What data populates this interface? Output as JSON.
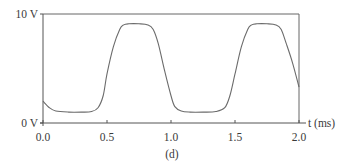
{
  "chart_data": {
    "type": "line",
    "title": "",
    "caption": "(d)",
    "xlabel": "t (ms)",
    "ylabel": "",
    "xlim": [
      0.0,
      2.0
    ],
    "ylim": [
      0,
      10
    ],
    "x_ticks": [
      "0.0",
      "0.5",
      "1.0",
      "1.5",
      "2.0"
    ],
    "y_ticks": [
      "0 V",
      "10 V"
    ],
    "grid": false,
    "legend": null,
    "series": [
      {
        "name": "voltage",
        "x": [
          0.0,
          0.05,
          0.1,
          0.2,
          0.3,
          0.38,
          0.43,
          0.47,
          0.5,
          0.55,
          0.6,
          0.63,
          0.67,
          0.75,
          0.82,
          0.86,
          0.9,
          0.95,
          1.0,
          1.03,
          1.08,
          1.15,
          1.25,
          1.35,
          1.42,
          1.46,
          1.5,
          1.55,
          1.6,
          1.63,
          1.67,
          1.75,
          1.82,
          1.86,
          1.9,
          1.95,
          2.0
        ],
        "y": [
          2.0,
          1.4,
          1.1,
          1.0,
          1.0,
          1.05,
          1.4,
          2.5,
          4.5,
          7.0,
          8.6,
          9.0,
          9.1,
          9.1,
          9.0,
          8.6,
          7.3,
          4.8,
          2.5,
          1.5,
          1.1,
          1.0,
          1.0,
          1.05,
          1.4,
          2.5,
          4.5,
          7.0,
          8.6,
          9.0,
          9.1,
          9.1,
          9.0,
          8.6,
          7.3,
          5.5,
          3.3
        ]
      }
    ],
    "axis_color": "#555555",
    "line_color": "#6b6b6b"
  },
  "labels": {
    "y_top": "10 V",
    "y_bottom": "0 V",
    "x0": "0.0",
    "x1": "0.5",
    "x2": "1.0",
    "x3": "1.5",
    "x4": "2.0",
    "x_axis_title": "t (ms)",
    "caption": "(d)"
  }
}
